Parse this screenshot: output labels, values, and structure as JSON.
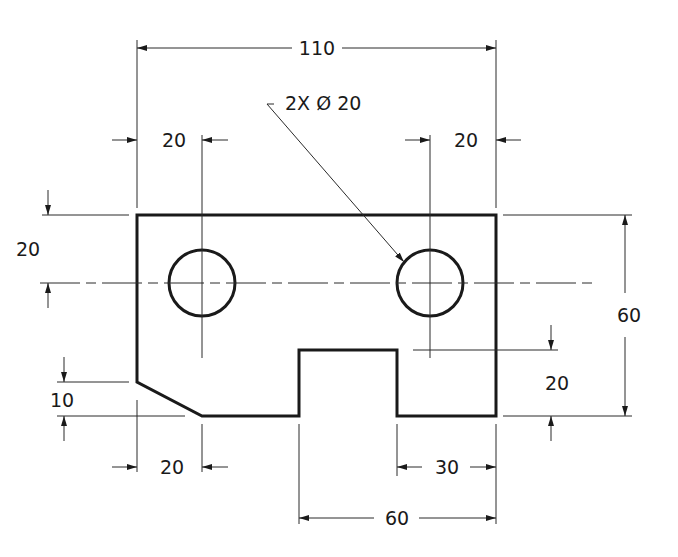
{
  "drawing": {
    "type": "engineering-drawing",
    "units": "mm",
    "callouts": {
      "hole_note": "2X Ø 20"
    },
    "dimensions": {
      "overall_width": "110",
      "overall_height": "60",
      "left_hole_offset_x": "20",
      "right_hole_offset_x": "20",
      "hole_offset_y_from_top": "20",
      "chamfer_height": "10",
      "chamfer_width": "20",
      "notch_right_step": "30",
      "notch_span": "60",
      "notch_depth": "20"
    },
    "colors": {
      "line": "#1a1a1a",
      "background": "#ffffff"
    }
  }
}
